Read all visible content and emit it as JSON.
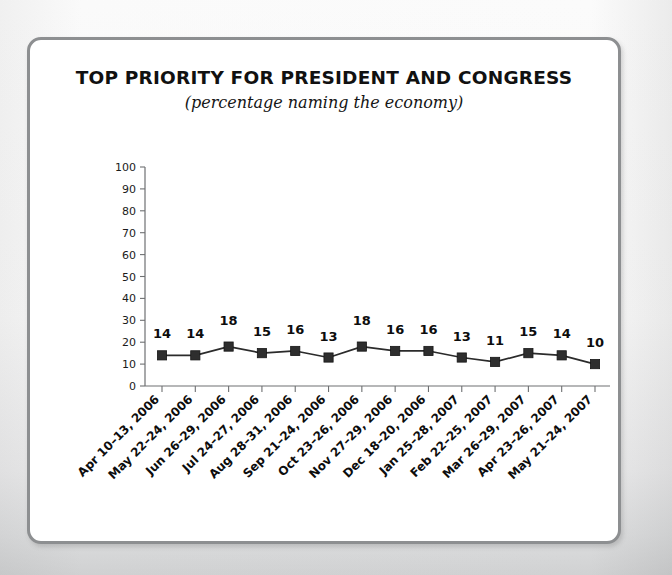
{
  "figure": {
    "background_color": "#fbfbfb",
    "card_background": "#ffffff",
    "frame_color": "#8d8f91"
  },
  "chart_data": {
    "type": "line",
    "title": "TOP PRIORITY FOR PRESIDENT AND CONGRESS",
    "subtitle": "(percentage naming the economy)",
    "xlabel": "",
    "ylabel": "",
    "ylim": [
      0,
      100
    ],
    "yticks": [
      0,
      10,
      20,
      30,
      40,
      50,
      60,
      70,
      80,
      90,
      100
    ],
    "ytick_labels": [
      "0",
      "10",
      "20",
      "30",
      "40",
      "50",
      "60",
      "70",
      "80",
      "90",
      "100"
    ],
    "grid": false,
    "legend": false,
    "marker": "square",
    "series_color": "#2e2e2e",
    "show_data_labels": true,
    "categories": [
      "Apr 10–13, 2006",
      "May 22–24, 2006",
      "Jun 26–29, 2006",
      "Jul 24–27, 2006",
      "Aug 28–31, 2006",
      "Sep 21–24, 2006",
      "Oct 23–26, 2006",
      "Nov 27–29, 2006",
      "Dec 18–20, 2006",
      "Jan 25–28, 2007",
      "Feb 22–25, 2007",
      "Mar 26–29, 2007",
      "Apr 23–26, 2007",
      "May 21–24, 2007"
    ],
    "values": [
      14,
      14,
      18,
      15,
      16,
      13,
      18,
      16,
      16,
      13,
      11,
      15,
      14,
      10
    ],
    "data_labels": [
      "14",
      "14",
      "18",
      "15",
      "16",
      "13",
      "18",
      "16",
      "16",
      "13",
      "11",
      "15",
      "14",
      "10"
    ]
  }
}
